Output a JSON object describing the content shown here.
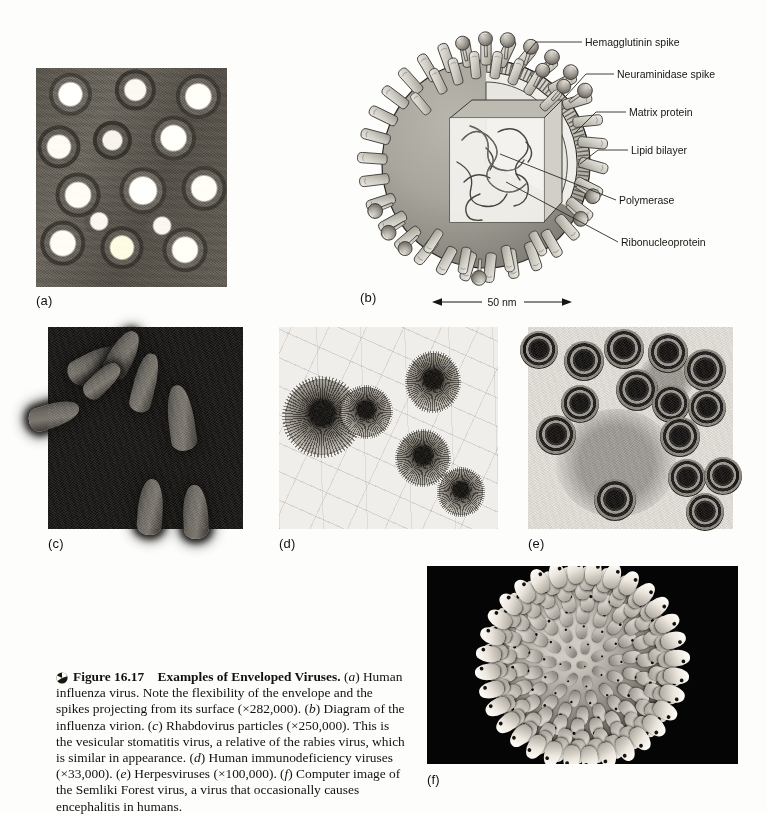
{
  "figure": {
    "number": "Figure 16.17",
    "title": "Examples of Enveloped Viruses.",
    "caption_body": "(a) Human influenza virus. Note the flexibility of the envelope and the spikes projecting from its surface (×282,000). (b) Diagram of the influenza virion. (c) Rhabdovirus particles (×250,000). This is the vesicular stomatitis virus, a relative of the rabies virus, which is similar in appearance. (d) Human immunodeficiency viruses (×33,000). (e) Herpesviruses (×100,000). (f) Computer image of the Semliki Forest virus, a virus that occasionally causes encephalitis in humans.",
    "bullet_icon": "pie-sphere-icon"
  },
  "panels": [
    {
      "key": "a",
      "label": "(a)",
      "kind": "micrograph",
      "subject": "Human influenza virus",
      "magnification": "×282,000"
    },
    {
      "key": "b",
      "label": "(b)",
      "kind": "diagram",
      "subject": "Diagram of the influenza virion",
      "magnification": ""
    },
    {
      "key": "c",
      "label": "(c)",
      "kind": "micrograph",
      "subject": "Rhabdovirus particles (vesicular stomatitis virus)",
      "magnification": "×250,000"
    },
    {
      "key": "d",
      "label": "(d)",
      "kind": "micrograph",
      "subject": "Human immunodeficiency viruses",
      "magnification": "×33,000"
    },
    {
      "key": "e",
      "label": "(e)",
      "kind": "micrograph",
      "subject": "Herpesviruses",
      "magnification": "×100,000"
    },
    {
      "key": "f",
      "label": "(f)",
      "kind": "computer-image",
      "subject": "Semliki Forest virus",
      "magnification": ""
    }
  ],
  "diagram": {
    "labels": [
      {
        "id": "hemagglutinin",
        "text": "Hemagglutinin spike"
      },
      {
        "id": "neuraminidase",
        "text": "Neuraminidase spike"
      },
      {
        "id": "matrix",
        "text": "Matrix protein"
      },
      {
        "id": "lipid",
        "text": "Lipid bilayer"
      },
      {
        "id": "polymerase",
        "text": "Polymerase"
      },
      {
        "id": "ribonucleoprotein",
        "text": "Ribonucleoprotein"
      }
    ],
    "scale_bar": {
      "text": "50 nm"
    }
  },
  "colors": {
    "page_background": "#fdfdfb",
    "ink": "#111111",
    "diagram_fill": "#c9c6bf",
    "diagram_stroke": "#2b2a24",
    "panel_f_background": "#050505"
  }
}
